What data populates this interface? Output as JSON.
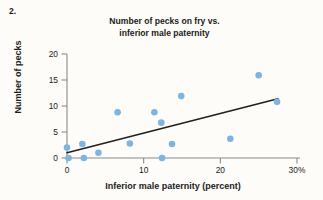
{
  "question_number": "2.",
  "chart_data": {
    "type": "scatter",
    "title": "Number of pecks on fry vs. inferior male paternity",
    "title_lines": [
      "Number of pecks on fry vs.",
      "inferior male paternity"
    ],
    "xlabel": "Inferior male paternity (percent)",
    "ylabel": "Number of pecks",
    "xlim": [
      0,
      30
    ],
    "ylim": [
      0,
      20
    ],
    "xticks": [
      0,
      10,
      20,
      30
    ],
    "xtick_labels": [
      "0",
      "10",
      "20",
      "30%"
    ],
    "yticks": [
      0,
      5,
      10,
      15,
      20
    ],
    "ytick_labels": [
      "0",
      "5",
      "10",
      "15",
      "20"
    ],
    "grid": false,
    "legend": "none",
    "point_color": "#7eb4e2",
    "line_color": "#231f20",
    "axis_color": "#8a8a8a",
    "points": [
      {
        "x": 0.0,
        "y": 2.0
      },
      {
        "x": 0.2,
        "y": 0.0
      },
      {
        "x": 2.0,
        "y": 2.7
      },
      {
        "x": 2.2,
        "y": 0.0
      },
      {
        "x": 4.1,
        "y": 1.0
      },
      {
        "x": 6.6,
        "y": 8.8
      },
      {
        "x": 8.2,
        "y": 2.8
      },
      {
        "x": 11.4,
        "y": 8.8
      },
      {
        "x": 12.3,
        "y": 6.8
      },
      {
        "x": 12.4,
        "y": 0.0
      },
      {
        "x": 13.7,
        "y": 2.7
      },
      {
        "x": 14.9,
        "y": 11.9
      },
      {
        "x": 21.3,
        "y": 3.7
      },
      {
        "x": 25.0,
        "y": 15.9
      },
      {
        "x": 27.4,
        "y": 10.8
      }
    ],
    "trend_line": {
      "x_start": 0.0,
      "y_start": 1.0,
      "x_end": 27.5,
      "y_end": 11.4
    }
  }
}
